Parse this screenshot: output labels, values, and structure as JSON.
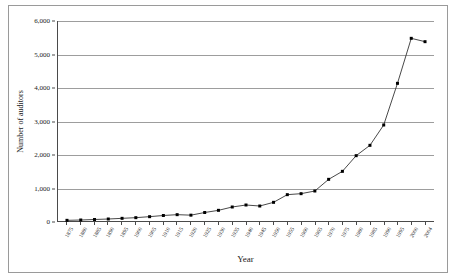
{
  "chart_data": {
    "type": "line",
    "title": "",
    "xlabel": "Year",
    "ylabel": "Number of auditors",
    "ylim": [
      0,
      6000
    ],
    "ytick_labels": [
      "0",
      "1,000",
      "2,000",
      "3,000",
      "4,000",
      "5,000",
      "6,000"
    ],
    "ytick_values": [
      0,
      1000,
      2000,
      3000,
      4000,
      5000,
      6000
    ],
    "grid": true,
    "legend": "none",
    "marker": "filled-square",
    "line_color": "#333333",
    "marker_color": "#000000",
    "categories": [
      "1875",
      "1880",
      "1885",
      "1890",
      "1895",
      "1900",
      "1905",
      "1910",
      "1915",
      "1920",
      "1925",
      "1930",
      "1935",
      "1940",
      "1945",
      "1950",
      "1955",
      "1960",
      "1965",
      "1970",
      "1975",
      "1980",
      "1985",
      "1990",
      "1995",
      "2000",
      "2004"
    ],
    "values": [
      20,
      30,
      45,
      60,
      80,
      100,
      130,
      165,
      190,
      175,
      255,
      320,
      420,
      480,
      450,
      560,
      790,
      820,
      900,
      1250,
      1490,
      1960,
      2270,
      2880,
      4130,
      5480,
      5380
    ]
  }
}
